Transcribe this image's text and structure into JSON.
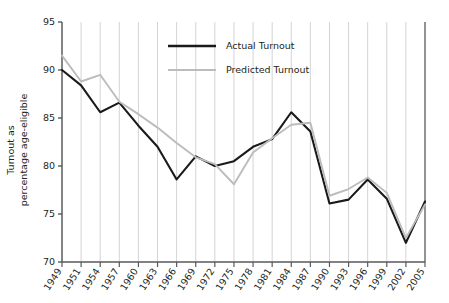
{
  "chart_data": {
    "type": "line",
    "title": "",
    "xlabel": "",
    "ylabel": "Turnout as percentage age-eligible",
    "ylabel_line1": "Turnout as",
    "ylabel_line2": "percentage age-eligible",
    "ylim": [
      70,
      95
    ],
    "yticks": [
      70,
      75,
      80,
      85,
      90,
      95
    ],
    "ytick_labels": [
      "70",
      "75",
      "80",
      "85",
      "90",
      "95"
    ],
    "grid": "vertical",
    "legend_position": "upper-center",
    "categories": [
      "1949",
      "1951",
      "1954",
      "1957",
      "1960",
      "1963",
      "1966",
      "1969",
      "1972",
      "1975",
      "1978",
      "1981",
      "1984",
      "1987",
      "1990",
      "1993",
      "1996",
      "1999",
      "2002",
      "2005"
    ],
    "series": [
      {
        "name": "Actual Turnout",
        "color": "#1a1a1a",
        "values": [
          90.0,
          88.4,
          85.6,
          86.6,
          84.2,
          82.0,
          78.6,
          81.0,
          80.0,
          80.5,
          82.0,
          82.8,
          85.6,
          83.6,
          76.1,
          76.5,
          78.6,
          76.6,
          72.0,
          76.3
        ]
      },
      {
        "name": "Predicted Turnout",
        "color": "#bcbcbc",
        "values": [
          91.5,
          88.8,
          89.5,
          86.7,
          85.4,
          84.0,
          82.4,
          80.9,
          80.2,
          78.1,
          81.4,
          82.9,
          84.3,
          84.5,
          76.9,
          77.6,
          78.8,
          77.2,
          72.5,
          76.0
        ]
      }
    ]
  },
  "legend": {
    "entries": [
      {
        "label": "Actual Turnout",
        "color": "#1a1a1a"
      },
      {
        "label": "Predicted Turnout",
        "color": "#bcbcbc"
      }
    ]
  }
}
